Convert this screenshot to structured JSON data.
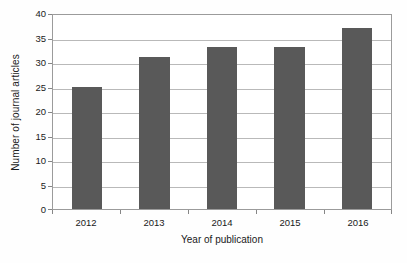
{
  "chart_data": {
    "type": "bar",
    "title": "",
    "subtitle": "",
    "categories": [
      "2012",
      "2013",
      "2014",
      "2015",
      "2016"
    ],
    "values": [
      25,
      31,
      33,
      33,
      37
    ],
    "series": [
      {
        "name": "Number of journal articles",
        "values": [
          25,
          31,
          33,
          33,
          37
        ]
      }
    ],
    "xlabel": "Year of publication",
    "ylabel": "Number of journal articles",
    "ylim": [
      0,
      40
    ],
    "ytick_labels": [
      "0",
      "5",
      "10",
      "15",
      "20",
      "25",
      "30",
      "35",
      "40"
    ],
    "ytick_values": [
      0,
      5,
      10,
      15,
      20,
      25,
      30,
      35,
      40
    ],
    "grid": "horizontal",
    "legend": "none",
    "annotations": [],
    "colors": {
      "bar_fill": "#595959",
      "gridline": "#b9b9b9",
      "plot_border": "#9b9b9b",
      "tick_mark": "#868686",
      "background": "#ffffff",
      "text": "#1a1a1a"
    }
  }
}
